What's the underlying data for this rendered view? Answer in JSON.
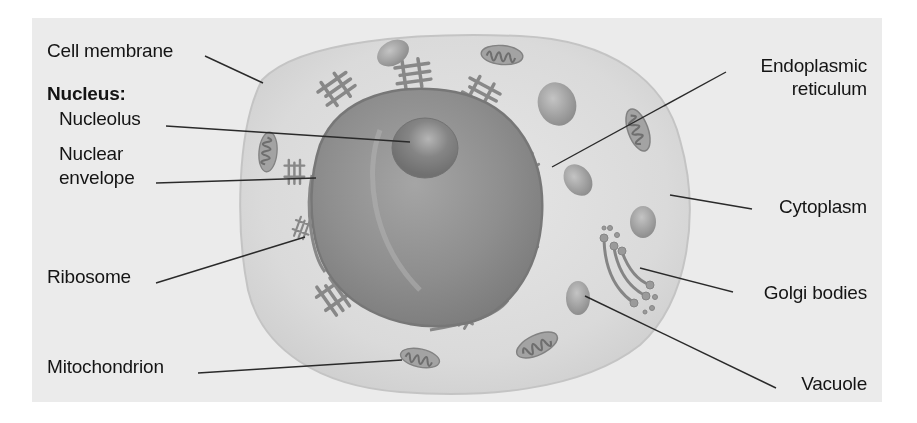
{
  "diagram": {
    "labels_left": {
      "cell_membrane": "Cell membrane",
      "nucleus_heading": "Nucleus:",
      "nucleolus": "Nucleolus",
      "nuclear_envelope_1": "Nuclear",
      "nuclear_envelope_2": "envelope",
      "ribosome": "Ribosome",
      "mitochondrion": "Mitochondrion"
    },
    "labels_right": {
      "er_1": "Endoplasmic",
      "er_2": "reticulum",
      "cytoplasm": "Cytoplasm",
      "golgi": "Golgi bodies",
      "vacuole": "Vacuole"
    },
    "colors": {
      "background": "#ebebeb",
      "cytoplasm": "#dcdcdc",
      "nucleus": "#8f8f8f",
      "organelle": "#8a8a8a",
      "leader_line": "#2a2a2a",
      "text": "#141414"
    }
  }
}
